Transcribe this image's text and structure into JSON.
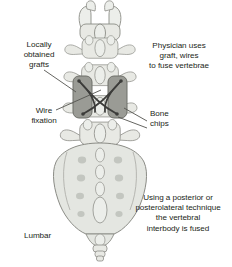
{
  "figure": {
    "background_color": "#ffffff",
    "text_color": "#231f20"
  },
  "labels": {
    "locally_obtained_grafts": "Locally\nobtained\ngrafts",
    "physician_uses": "Physician uses\ngraft, wires\nto fuse vertebrae",
    "wire_fixation": "Wire\nfixation",
    "bone_chips": "Bone\nchips",
    "posterior_technique": "Using a posterior or\nposterolateral technique\nthe vertebral\ninterbody is fused",
    "lumbar": "Lumbar"
  },
  "anatomy": {
    "bone_fill": "#e8e9e4",
    "bone_fill_light": "#eceeea",
    "bone_stroke": "#8b8c86",
    "sacrum_fill": "#e4e6e1",
    "foramen_fill": "#c3c6c0",
    "graft_fill": "#9a9b95",
    "graft_stroke": "#6d6e68",
    "wire_color": "#3c3c3a",
    "leader_color": "#54544f",
    "vertebra_count": 4,
    "graft_blocks": 2,
    "sacral_foramen_rows": 4,
    "sacral_foramen_columns": 2
  }
}
